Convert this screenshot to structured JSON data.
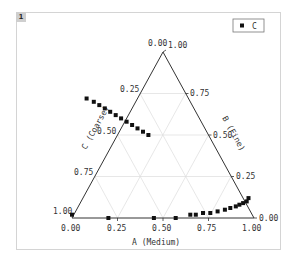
{
  "panel": {
    "badge": "1"
  },
  "legend": {
    "label": "C",
    "marker": "filled-square"
  },
  "chart_data": {
    "type": "scatter",
    "subtype": "ternary",
    "title": "",
    "axes": {
      "A": {
        "label": "A (Medium)",
        "ticks": [
          "0.00",
          "0.25",
          "0.50",
          "0.75",
          "1.00"
        ]
      },
      "B": {
        "label": "B (Fine)",
        "ticks": [
          "0.00",
          "0.25",
          "0.50",
          "0.75",
          "1.00"
        ]
      },
      "C": {
        "label": "C (Coarse)",
        "ticks": [
          "0.00",
          "0.25",
          "0.50",
          "0.75",
          "1.00"
        ]
      }
    },
    "grid": true,
    "legend_position": "top-right",
    "series": [
      {
        "name": "C",
        "points_ABC": [
          [
            0.0,
            0.02,
            0.98
          ],
          [
            0.2,
            0.0,
            1.0
          ],
          [
            0.45,
            0.0,
            0.55
          ],
          [
            0.57,
            0.0,
            0.43
          ],
          [
            0.65,
            0.02,
            0.33
          ],
          [
            0.68,
            0.02,
            0.3
          ],
          [
            0.72,
            0.03,
            0.25
          ],
          [
            0.76,
            0.03,
            0.21
          ],
          [
            0.8,
            0.04,
            0.16
          ],
          [
            0.84,
            0.05,
            0.11
          ],
          [
            0.87,
            0.06,
            0.07
          ],
          [
            0.9,
            0.07,
            0.03
          ],
          [
            0.92,
            0.08,
            0.0
          ],
          [
            0.94,
            0.09,
            0.0
          ],
          [
            0.96,
            0.1,
            0.0
          ],
          [
            0.97,
            0.12,
            0.0
          ],
          [
            0.08,
            0.72,
            0.2
          ],
          [
            0.12,
            0.7,
            0.18
          ],
          [
            0.15,
            0.68,
            0.17
          ],
          [
            0.18,
            0.66,
            0.16
          ],
          [
            0.21,
            0.64,
            0.15
          ],
          [
            0.24,
            0.62,
            0.14
          ],
          [
            0.27,
            0.6,
            0.13
          ],
          [
            0.3,
            0.58,
            0.12
          ],
          [
            0.33,
            0.56,
            0.11
          ],
          [
            0.36,
            0.54,
            0.1
          ],
          [
            0.39,
            0.52,
            0.09
          ],
          [
            0.42,
            0.5,
            0.08
          ]
        ]
      }
    ]
  }
}
